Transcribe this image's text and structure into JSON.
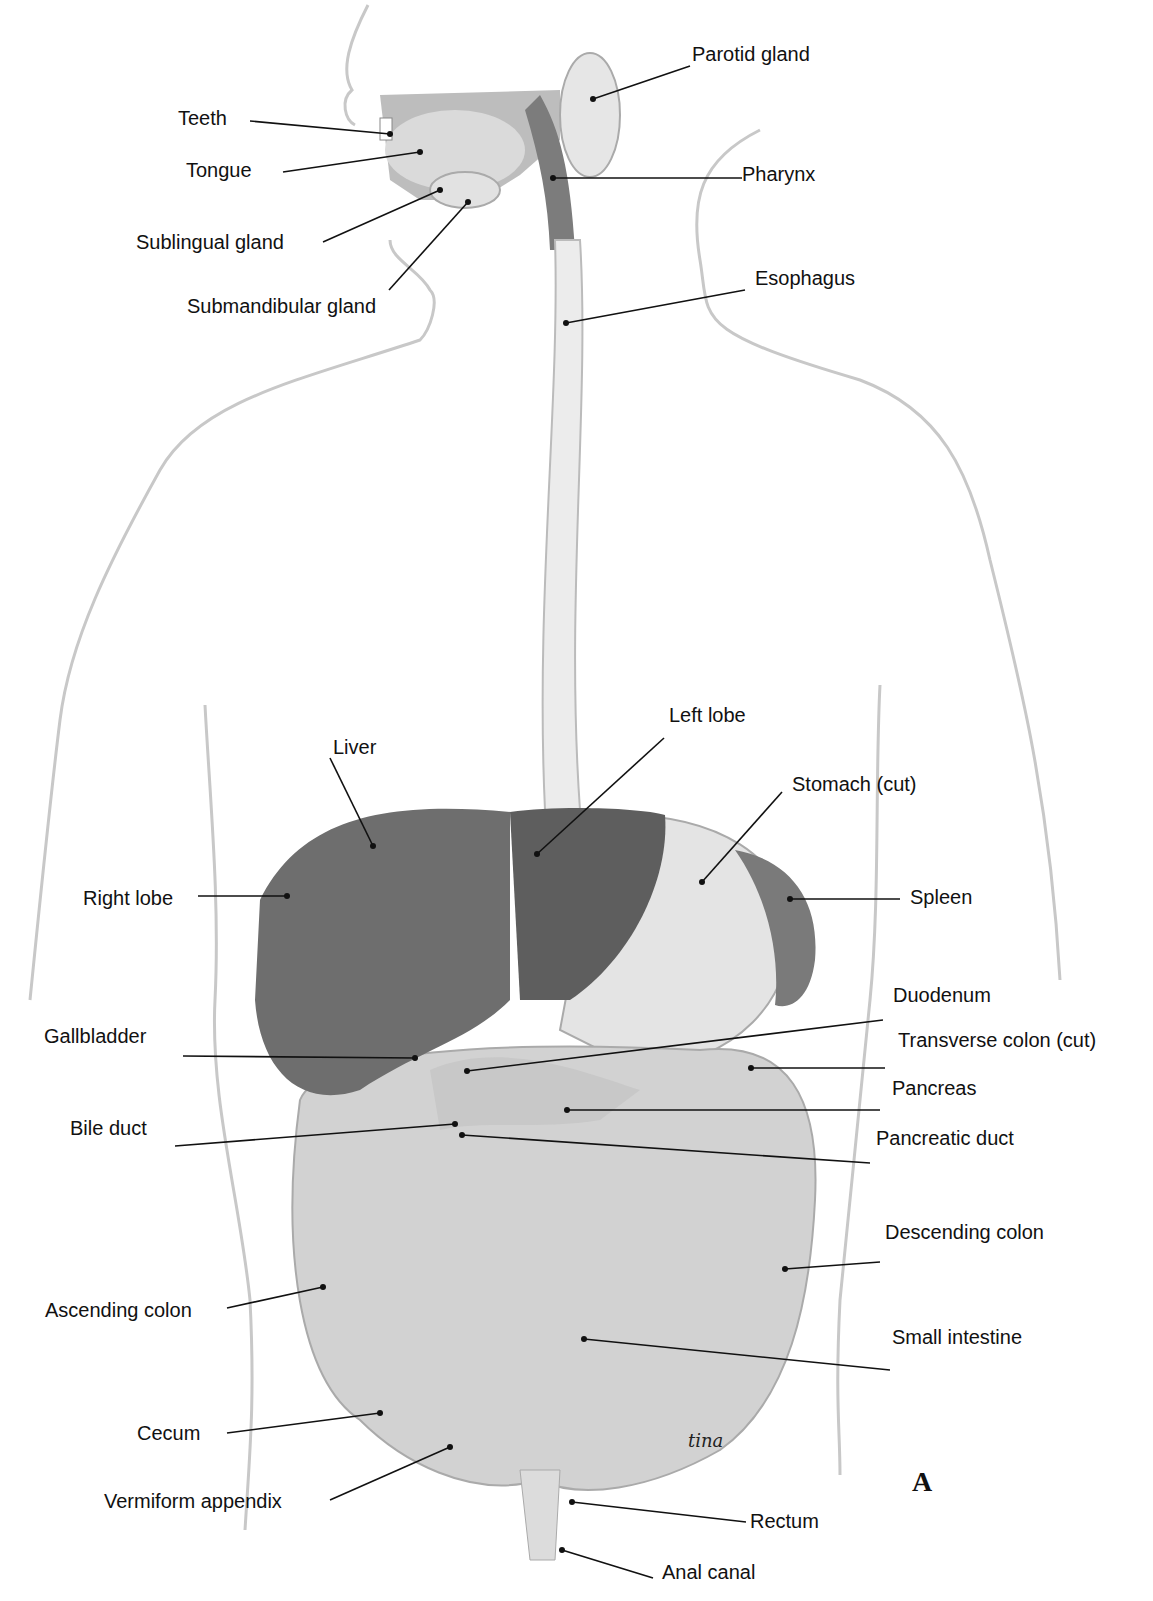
{
  "figure": {
    "panel_letter": "A",
    "signature": "tina"
  },
  "labels": {
    "teeth": "Teeth",
    "tongue": "Tongue",
    "sublingual_gland": "Sublingual gland",
    "submandibular_gland": "Submandibular gland",
    "parotid_gland": "Parotid gland",
    "pharynx": "Pharynx",
    "esophagus": "Esophagus",
    "liver": "Liver",
    "left_lobe": "Left lobe",
    "stomach_cut": "Stomach (cut)",
    "right_lobe": "Right lobe",
    "spleen": "Spleen",
    "duodenum": "Duodenum",
    "gallbladder": "Gallbladder",
    "transverse_colon_cut": "Transverse colon (cut)",
    "pancreas": "Pancreas",
    "bile_duct": "Bile duct",
    "pancreatic_duct": "Pancreatic duct",
    "descending_colon": "Descending colon",
    "ascending_colon": "Ascending colon",
    "small_intestine": "Small intestine",
    "cecum": "Cecum",
    "vermiform_appendix": "Vermiform appendix",
    "rectum": "Rectum",
    "anal_canal": "Anal canal"
  },
  "colors": {
    "outline": "#c8c8c8",
    "liver": "#6e6e6e",
    "left_lobe": "#5e5e5e",
    "stomach": "#e4e4e4",
    "spleen": "#7a7a7a",
    "intestine": "#d2d2d2",
    "leader": "#111111"
  }
}
